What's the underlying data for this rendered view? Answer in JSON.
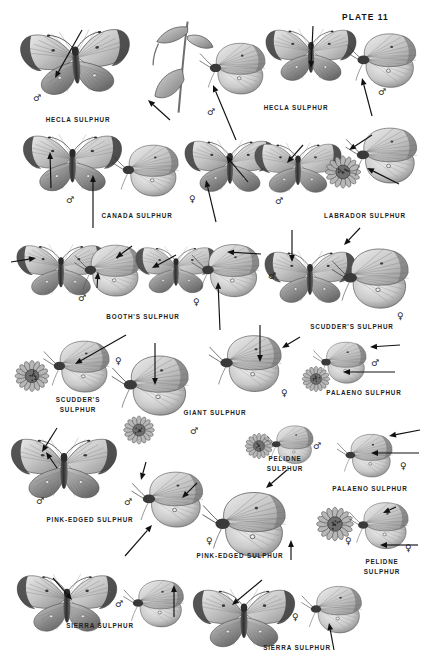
{
  "plate": {
    "title": "PLATE 11",
    "title_pos": {
      "x": 342,
      "y": 12
    },
    "width": 427,
    "height": 669,
    "background": "#ffffff",
    "ink": "#1d1d1d"
  },
  "species_labels": [
    {
      "id": "hecla-1",
      "text": "HECLA SULPHUR",
      "x": 78,
      "y": 115,
      "lines": [
        "HECLA SULPHUR"
      ]
    },
    {
      "id": "hecla-2",
      "text": "HECLA SULPHUR",
      "x": 296,
      "y": 103,
      "lines": [
        "HECLA SULPHUR"
      ]
    },
    {
      "id": "canada",
      "text": "CANADA SULPHUR",
      "x": 137,
      "y": 211,
      "lines": [
        "CANADA SULPHUR"
      ]
    },
    {
      "id": "labrador",
      "text": "LABRADOR SULPHUR",
      "x": 365,
      "y": 211,
      "lines": [
        "LABRADOR SULPHUR"
      ]
    },
    {
      "id": "booths",
      "text": "BOOTH'S SULPHUR",
      "x": 143,
      "y": 312,
      "lines": [
        "BOOTH'S SULPHUR"
      ]
    },
    {
      "id": "scudders-1",
      "text": "SCUDDER'S SULPHUR",
      "x": 352,
      "y": 322,
      "lines": [
        "SCUDDER'S SULPHUR"
      ]
    },
    {
      "id": "scudders-2",
      "text": "SCUDDER'S SULPHUR",
      "x": 78,
      "y": 395,
      "lines": [
        "SCUDDER'S",
        "SULPHUR"
      ]
    },
    {
      "id": "giant",
      "text": "GIANT SULPHUR",
      "x": 215,
      "y": 408,
      "lines": [
        "GIANT SULPHUR"
      ]
    },
    {
      "id": "palaeno-1",
      "text": "PALAENO SULPHUR",
      "x": 364,
      "y": 388,
      "lines": [
        "PALAENO SULPHUR"
      ]
    },
    {
      "id": "pelidne-1",
      "text": "PELIDNE SULPHUR",
      "x": 285,
      "y": 454,
      "lines": [
        "PELIDNE",
        "SULPHUR"
      ]
    },
    {
      "id": "palaeno-2",
      "text": "PALAENO SULPHUR",
      "x": 370,
      "y": 484,
      "lines": [
        "PALAENO SULPHUR"
      ]
    },
    {
      "id": "pink-edged-1",
      "text": "PINK-EDGED SULPHUR",
      "x": 90,
      "y": 515,
      "lines": [
        "PINK-EDGED SULPHUR"
      ]
    },
    {
      "id": "pink-edged-2",
      "text": "PINK-EDGED SULPHUR",
      "x": 240,
      "y": 551,
      "lines": [
        "PINK-EDGED SULPHUR"
      ]
    },
    {
      "id": "pelidne-2",
      "text": "PELIDNE SULPHUR",
      "x": 382,
      "y": 557,
      "lines": [
        "PELIDNE",
        "SULPHUR"
      ]
    },
    {
      "id": "sierra-1",
      "text": "SIERRA SULPHUR",
      "x": 100,
      "y": 621,
      "lines": [
        "SIERRA SULPHUR"
      ]
    },
    {
      "id": "sierra-2",
      "text": "SIERRA SULPHUR",
      "x": 297,
      "y": 643,
      "lines": [
        "SIERRA SULPHUR"
      ]
    }
  ],
  "sex_marks": [
    {
      "id": "m01",
      "symbol": "♂",
      "x": 33,
      "y": 94
    },
    {
      "id": "m02",
      "symbol": "♂",
      "x": 207,
      "y": 108
    },
    {
      "id": "m03",
      "symbol": "♂",
      "x": 378,
      "y": 88
    },
    {
      "id": "m04",
      "symbol": "♂",
      "x": 66,
      "y": 196
    },
    {
      "id": "m05",
      "symbol": "♀",
      "x": 189,
      "y": 195
    },
    {
      "id": "m06",
      "symbol": "♂",
      "x": 275,
      "y": 197
    },
    {
      "id": "m07",
      "symbol": "♂",
      "x": 78,
      "y": 294
    },
    {
      "id": "m08",
      "symbol": "♀",
      "x": 193,
      "y": 298
    },
    {
      "id": "m09",
      "symbol": "♂",
      "x": 268,
      "y": 272
    },
    {
      "id": "m10",
      "symbol": "♀",
      "x": 397,
      "y": 312
    },
    {
      "id": "m11",
      "symbol": "♀",
      "x": 115,
      "y": 357
    },
    {
      "id": "m12",
      "symbol": "♂",
      "x": 190,
      "y": 427
    },
    {
      "id": "m13",
      "symbol": "♀",
      "x": 281,
      "y": 389
    },
    {
      "id": "m14",
      "symbol": "♂",
      "x": 371,
      "y": 359
    },
    {
      "id": "m15",
      "symbol": "♂",
      "x": 313,
      "y": 442
    },
    {
      "id": "m16",
      "symbol": "♀",
      "x": 400,
      "y": 462
    },
    {
      "id": "m17",
      "symbol": "♂",
      "x": 36,
      "y": 497
    },
    {
      "id": "m18",
      "symbol": "♂",
      "x": 124,
      "y": 498
    },
    {
      "id": "m19",
      "symbol": "♀",
      "x": 206,
      "y": 537
    },
    {
      "id": "m20",
      "symbol": "♀",
      "x": 345,
      "y": 537
    },
    {
      "id": "m21",
      "symbol": "♀",
      "x": 405,
      "y": 544
    },
    {
      "id": "m22",
      "symbol": "♂",
      "x": 115,
      "y": 600
    },
    {
      "id": "m23",
      "symbol": "♀",
      "x": 292,
      "y": 613
    }
  ],
  "pointers": [
    {
      "id": "p01",
      "x1": 82,
      "y1": 30,
      "x2": 55,
      "y2": 78
    },
    {
      "id": "p02",
      "x1": 170,
      "y1": 120,
      "x2": 148,
      "y2": 100
    },
    {
      "id": "p03",
      "x1": 236,
      "y1": 140,
      "x2": 213,
      "y2": 85
    },
    {
      "id": "p04",
      "x1": 313,
      "y1": 26,
      "x2": 311,
      "y2": 68
    },
    {
      "id": "p05",
      "x1": 372,
      "y1": 116,
      "x2": 362,
      "y2": 78
    },
    {
      "id": "p06",
      "x1": 51,
      "y1": 188,
      "x2": 50,
      "y2": 152
    },
    {
      "id": "p07",
      "x1": 93,
      "y1": 228,
      "x2": 93,
      "y2": 175
    },
    {
      "id": "p08",
      "x1": 216,
      "y1": 222,
      "x2": 206,
      "y2": 180
    },
    {
      "id": "p09",
      "x1": 248,
      "y1": 182,
      "x2": 226,
      "y2": 156
    },
    {
      "id": "p10",
      "x1": 303,
      "y1": 145,
      "x2": 287,
      "y2": 163
    },
    {
      "id": "p11",
      "x1": 399,
      "y1": 184,
      "x2": 367,
      "y2": 168
    },
    {
      "id": "p12",
      "x1": 372,
      "y1": 135,
      "x2": 349,
      "y2": 150
    },
    {
      "id": "p13",
      "x1": 11,
      "y1": 262,
      "x2": 36,
      "y2": 258
    },
    {
      "id": "p14",
      "x1": 97,
      "y1": 288,
      "x2": 98,
      "y2": 272
    },
    {
      "id": "p15",
      "x1": 132,
      "y1": 246,
      "x2": 116,
      "y2": 258
    },
    {
      "id": "p16",
      "x1": 176,
      "y1": 255,
      "x2": 152,
      "y2": 268
    },
    {
      "id": "p17",
      "x1": 261,
      "y1": 254,
      "x2": 227,
      "y2": 252
    },
    {
      "id": "p18",
      "x1": 220,
      "y1": 330,
      "x2": 218,
      "y2": 282
    },
    {
      "id": "p19",
      "x1": 292,
      "y1": 230,
      "x2": 292,
      "y2": 262
    },
    {
      "id": "p20",
      "x1": 360,
      "y1": 228,
      "x2": 344,
      "y2": 245
    },
    {
      "id": "p21",
      "x1": 126,
      "y1": 335,
      "x2": 75,
      "y2": 364
    },
    {
      "id": "p22",
      "x1": 155,
      "y1": 343,
      "x2": 155,
      "y2": 385
    },
    {
      "id": "p23",
      "x1": 260,
      "y1": 325,
      "x2": 260,
      "y2": 362
    },
    {
      "id": "p24",
      "x1": 300,
      "y1": 337,
      "x2": 282,
      "y2": 348
    },
    {
      "id": "p25",
      "x1": 400,
      "y1": 345,
      "x2": 370,
      "y2": 347
    },
    {
      "id": "p26",
      "x1": 395,
      "y1": 372,
      "x2": 343,
      "y2": 372
    },
    {
      "id": "p27",
      "x1": 57,
      "y1": 428,
      "x2": 42,
      "y2": 452
    },
    {
      "id": "p28",
      "x1": 146,
      "y1": 462,
      "x2": 141,
      "y2": 480
    },
    {
      "id": "p29",
      "x1": 125,
      "y1": 556,
      "x2": 152,
      "y2": 525
    },
    {
      "id": "p30",
      "x1": 420,
      "y1": 430,
      "x2": 389,
      "y2": 436
    },
    {
      "id": "p31",
      "x1": 419,
      "y1": 453,
      "x2": 371,
      "y2": 453
    },
    {
      "id": "p32",
      "x1": 396,
      "y1": 507,
      "x2": 383,
      "y2": 513
    },
    {
      "id": "p33",
      "x1": 418,
      "y1": 545,
      "x2": 380,
      "y2": 545
    },
    {
      "id": "p34",
      "x1": 197,
      "y1": 483,
      "x2": 182,
      "y2": 498
    },
    {
      "id": "p35",
      "x1": 287,
      "y1": 470,
      "x2": 266,
      "y2": 488
    },
    {
      "id": "p36",
      "x1": 291,
      "y1": 560,
      "x2": 291,
      "y2": 540
    },
    {
      "id": "p37",
      "x1": 53,
      "y1": 578,
      "x2": 72,
      "y2": 600
    },
    {
      "id": "p38",
      "x1": 174,
      "y1": 617,
      "x2": 174,
      "y2": 585
    },
    {
      "id": "p39",
      "x1": 262,
      "y1": 580,
      "x2": 232,
      "y2": 605
    },
    {
      "id": "p40",
      "x1": 334,
      "y1": 650,
      "x2": 329,
      "y2": 623
    },
    {
      "id": "p41",
      "x1": 57,
      "y1": 468,
      "x2": 46,
      "y2": 452
    }
  ],
  "specimens": [
    {
      "id": "s01",
      "kind": "spread",
      "x": 18,
      "y": 22,
      "w": 116,
      "h": 78,
      "tone": "#b8b8b4",
      "rot": -4
    },
    {
      "id": "s02",
      "kind": "plant",
      "x": 145,
      "y": 18,
      "w": 78,
      "h": 100,
      "tone": "#9f9f9c",
      "rot": 0
    },
    {
      "id": "s03",
      "kind": "side",
      "x": 198,
      "y": 38,
      "w": 72,
      "h": 62,
      "tone": "#a7a7a3",
      "rot": 0
    },
    {
      "id": "s04",
      "kind": "spread",
      "x": 263,
      "y": 18,
      "w": 96,
      "h": 72,
      "tone": "#b4b4b0",
      "rot": 0
    },
    {
      "id": "s05",
      "kind": "side",
      "x": 345,
      "y": 28,
      "w": 76,
      "h": 66,
      "tone": "#b9b9b5",
      "rot": 0
    },
    {
      "id": "s06",
      "kind": "spread",
      "x": 20,
      "y": 128,
      "w": 105,
      "h": 68,
      "tone": "#b0b0ac",
      "rot": 0
    },
    {
      "id": "s07",
      "kind": "side",
      "x": 108,
      "y": 140,
      "w": 78,
      "h": 62,
      "tone": "#a9a9a6",
      "rot": 0
    },
    {
      "id": "s08",
      "kind": "spread",
      "x": 182,
      "y": 132,
      "w": 96,
      "h": 66,
      "tone": "#bcbcb8",
      "rot": 0
    },
    {
      "id": "s09",
      "kind": "spread",
      "x": 252,
      "y": 132,
      "w": 92,
      "h": 70,
      "tone": "#a4a4a1",
      "rot": 0
    },
    {
      "id": "s10",
      "kind": "flower",
      "x": 320,
      "y": 148,
      "w": 46,
      "h": 48,
      "tone": "#9b9b98",
      "rot": 0
    },
    {
      "id": "s11",
      "kind": "side",
      "x": 344,
      "y": 122,
      "w": 78,
      "h": 68,
      "tone": "#9c9c99",
      "rot": 0
    },
    {
      "id": "s12",
      "kind": "spread",
      "x": 14,
      "y": 236,
      "w": 94,
      "h": 66,
      "tone": "#b3b3af",
      "rot": 0
    },
    {
      "id": "s13",
      "kind": "side",
      "x": 72,
      "y": 240,
      "w": 74,
      "h": 62,
      "tone": "#8f8f8c",
      "rot": 0
    },
    {
      "id": "s14",
      "kind": "spread",
      "x": 133,
      "y": 234,
      "w": 86,
      "h": 70,
      "tone": "#a8a8a4",
      "rot": 0
    },
    {
      "id": "s15",
      "kind": "side",
      "x": 190,
      "y": 238,
      "w": 74,
      "h": 66,
      "tone": "#979794",
      "rot": 0
    },
    {
      "id": "s16",
      "kind": "spread",
      "x": 262,
      "y": 240,
      "w": 96,
      "h": 72,
      "tone": "#c2c2be",
      "rot": 0
    },
    {
      "id": "s17",
      "kind": "side",
      "x": 330,
      "y": 242,
      "w": 84,
      "h": 74,
      "tone": "#d0d0cc",
      "rot": 0
    },
    {
      "id": "s18",
      "kind": "flower",
      "x": 10,
      "y": 352,
      "w": 44,
      "h": 48,
      "tone": "#9a9a97",
      "rot": 0
    },
    {
      "id": "s19",
      "kind": "side",
      "x": 40,
      "y": 336,
      "w": 76,
      "h": 62,
      "tone": "#a5a5a2",
      "rot": 0
    },
    {
      "id": "s20",
      "kind": "side",
      "x": 110,
      "y": 348,
      "w": 84,
      "h": 76,
      "tone": "#c4c4c0",
      "rot": 0
    },
    {
      "id": "s21",
      "kind": "flower",
      "x": 108,
      "y": 410,
      "w": 62,
      "h": 40,
      "tone": "#8e8e8b",
      "rot": 0
    },
    {
      "id": "s22",
      "kind": "side",
      "x": 200,
      "y": 330,
      "w": 94,
      "h": 68,
      "tone": "#b9b9b5",
      "rot": 0
    },
    {
      "id": "s23",
      "kind": "side",
      "x": 308,
      "y": 338,
      "w": 66,
      "h": 50,
      "tone": "#9d9d9a",
      "rot": 0
    },
    {
      "id": "s24",
      "kind": "flower",
      "x": 298,
      "y": 360,
      "w": 36,
      "h": 38,
      "tone": "#8c8c89",
      "rot": 0
    },
    {
      "id": "s25",
      "kind": "spread",
      "x": 8,
      "y": 428,
      "w": 112,
      "h": 78,
      "tone": "#d2d2ce",
      "rot": 0
    },
    {
      "id": "s26",
      "kind": "side",
      "x": 130,
      "y": 466,
      "w": 78,
      "h": 68,
      "tone": "#cececa",
      "rot": 0
    },
    {
      "id": "s27",
      "kind": "flower",
      "x": 236,
      "y": 428,
      "w": 46,
      "h": 36,
      "tone": "#8d8d8a",
      "rot": 0
    },
    {
      "id": "s28",
      "kind": "side",
      "x": 258,
      "y": 422,
      "w": 64,
      "h": 46,
      "tone": "#9a9a97",
      "rot": 0
    },
    {
      "id": "s29",
      "kind": "side",
      "x": 330,
      "y": 430,
      "w": 72,
      "h": 52,
      "tone": "#a2a2a0",
      "rot": 0
    },
    {
      "id": "s30",
      "kind": "side",
      "x": 196,
      "y": 486,
      "w": 100,
      "h": 78,
      "tone": "#cfcfcb",
      "rot": 0
    },
    {
      "id": "s31",
      "kind": "flower",
      "x": 308,
      "y": 500,
      "w": 54,
      "h": 48,
      "tone": "#9a9a97",
      "rot": 0
    },
    {
      "id": "s32",
      "kind": "side",
      "x": 340,
      "y": 498,
      "w": 80,
      "h": 56,
      "tone": "#d4d4d0",
      "rot": 0
    },
    {
      "id": "s33",
      "kind": "spread",
      "x": 14,
      "y": 564,
      "w": 106,
      "h": 76,
      "tone": "#9c9c99",
      "rot": 0
    },
    {
      "id": "s34",
      "kind": "side",
      "x": 122,
      "y": 570,
      "w": 66,
      "h": 68,
      "tone": "#a6a6a3",
      "rot": 0
    },
    {
      "id": "s35",
      "kind": "spread",
      "x": 190,
      "y": 578,
      "w": 108,
      "h": 78,
      "tone": "#a0a09d",
      "rot": 0
    },
    {
      "id": "s36",
      "kind": "side",
      "x": 300,
      "y": 574,
      "w": 66,
      "h": 72,
      "tone": "#acaca9",
      "rot": 0
    }
  ]
}
